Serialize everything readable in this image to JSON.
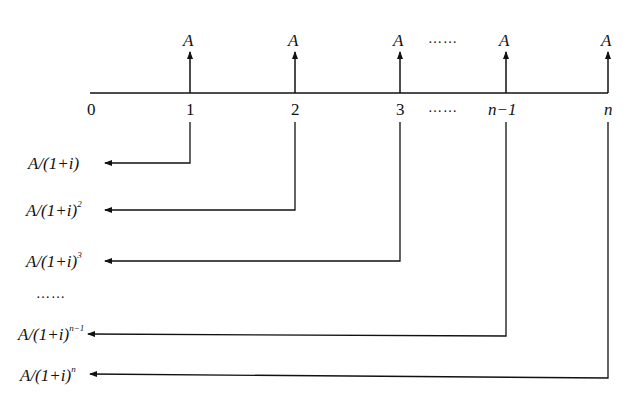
{
  "diagram": {
    "type": "cash-flow-timeline",
    "timeline": {
      "periods": [
        "0",
        "1",
        "2",
        "3",
        "……",
        "n−1",
        "n"
      ]
    },
    "payments": {
      "symbol": "A",
      "ellipsis": "……"
    },
    "present_values": [
      {
        "prefix": "A/(1+i)",
        "exponent": ""
      },
      {
        "prefix": "A/(1+i)",
        "exponent": "2"
      },
      {
        "prefix": "A/(1+i)",
        "exponent": "3"
      },
      {
        "prefix": "……",
        "exponent": ""
      },
      {
        "prefix": "A/(1+i)",
        "exponent": "n−1"
      },
      {
        "prefix": "A/(1+i)",
        "exponent": "n"
      }
    ],
    "line_color": "#111111"
  }
}
